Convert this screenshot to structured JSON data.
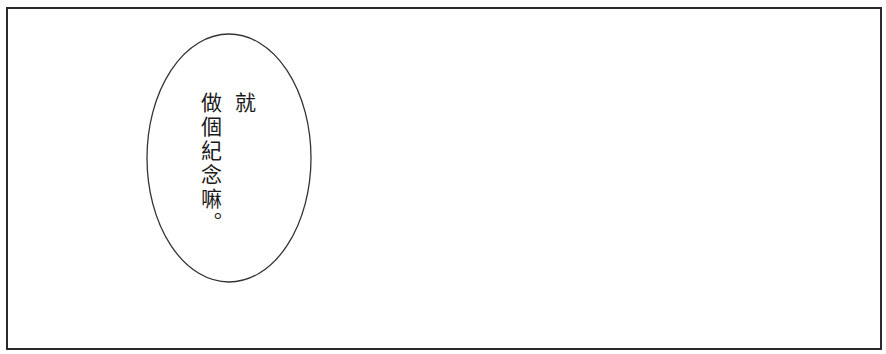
{
  "panel": {
    "border_color": "#2a2a2a",
    "background": "#ffffff"
  },
  "speech_bubble": {
    "lines": [
      "就",
      "做個紀念嘛。"
    ]
  }
}
